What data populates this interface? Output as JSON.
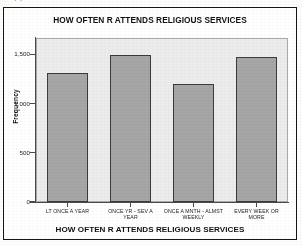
{
  "scan": {
    "top_edge_fragment": "·                    ·"
  },
  "figure": {
    "title": "HOW OFTEN R ATTENDS RELIGIOUS SERVICES",
    "x_axis_title": "HOW OFTEN R ATTENDS RELIGIOUS SERVICES",
    "y_axis_title": "Frequency",
    "bar_fill_color": "#a6a6a6",
    "bar_border_color": "#3b3b3b",
    "plot_background_color": "#ececec",
    "frame_color": "#161616"
  },
  "chart_data": {
    "type": "bar",
    "title": "HOW OFTEN R ATTENDS RELIGIOUS SERVICES",
    "xlabel": "HOW OFTEN R ATTENDS RELIGIOUS SERVICES",
    "ylabel": "Frequency",
    "categories": [
      "LT ONCE A YEAR",
      "ONCE YR - SEV A YEAR",
      "ONCE A MNTH - ALMST WEEKLY",
      "EVERY WEEK OR MORE"
    ],
    "category_lines": [
      [
        "LT ONCE A YEAR",
        ""
      ],
      [
        "ONCE YR - SEV A",
        "YEAR"
      ],
      [
        "ONCE A MNTH - ALMST",
        "WEEKLY"
      ],
      [
        "EVERY WEEK OR",
        "MORE"
      ]
    ],
    "values": [
      1310,
      1490,
      1195,
      1470
    ],
    "ylim": [
      0,
      1665
    ],
    "yticks": [
      0,
      500,
      1000,
      1500
    ],
    "ytick_labels": [
      "0",
      "500",
      "1,000",
      "1,500"
    ],
    "grid": false,
    "legend": false
  }
}
